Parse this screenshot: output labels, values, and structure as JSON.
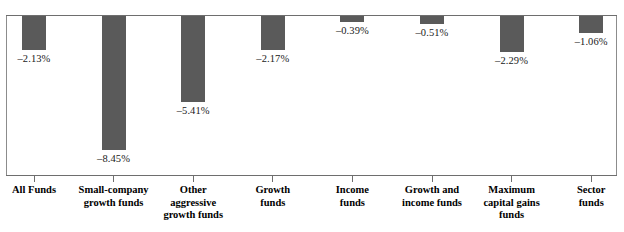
{
  "chart_data": {
    "type": "bar",
    "title": "",
    "subtitle": "",
    "xlabel": "",
    "ylabel": "",
    "orientation": "vertical",
    "grid": false,
    "legend": false,
    "legend_position": "none",
    "bar_color": "#5a5a5a",
    "axis_color": "#6e6e6e",
    "ylim": [
      -9,
      0
    ],
    "units": "percent",
    "categories": [
      "All Funds",
      "Small-company\ngrowth funds",
      "Other\naggressive\ngrowth funds",
      "Growth\nfunds",
      "Income\nfunds",
      "Growth and\nincome funds",
      "Maximum\ncapital gains\nfunds",
      "Sector\nfunds"
    ],
    "values": [
      -2.13,
      -8.45,
      -5.41,
      -2.17,
      -0.39,
      -0.51,
      -2.29,
      -1.06
    ],
    "data_labels": [
      "–2.13%",
      "–8.45%",
      "–5.41%",
      "–2.17%",
      "–0.39%",
      "–0.51%",
      "–2.29%",
      "–1.06%"
    ]
  }
}
